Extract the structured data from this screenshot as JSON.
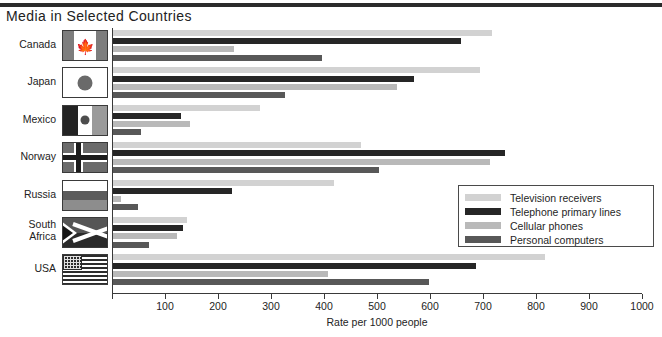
{
  "title": "Media in Selected Countries",
  "axis": {
    "xlabel": "Rate per 1000 people",
    "ticks": [
      0,
      100,
      200,
      300,
      400,
      500,
      600,
      700,
      800,
      900,
      1000
    ],
    "tick_labels": [
      "",
      "100",
      "200",
      "300",
      "400",
      "500",
      "600",
      "700",
      "800",
      "900",
      "1000"
    ]
  },
  "legend": {
    "items": [
      {
        "label": "Television receivers",
        "color": "#d2d2d2"
      },
      {
        "label": "Telephone primary lines",
        "color": "#262626"
      },
      {
        "label": "Cellular phones",
        "color": "#b9b9b9"
      },
      {
        "label": "Personal computers",
        "color": "#585858"
      }
    ]
  },
  "countries": [
    {
      "name": "Canada",
      "flag": "canada-flag"
    },
    {
      "name": "Japan",
      "flag": "japan-flag"
    },
    {
      "name": "Mexico",
      "flag": "mexico-flag"
    },
    {
      "name": "Norway",
      "flag": "norway-flag"
    },
    {
      "name": "Russia",
      "flag": "russia-flag"
    },
    {
      "name": "South Africa",
      "flag": "south-africa-flag"
    },
    {
      "name": "USA",
      "flag": "usa-flag"
    }
  ],
  "chart_data": {
    "type": "bar",
    "orientation": "horizontal",
    "title": "Media in Selected Countries",
    "xlabel": "Rate per 1000 people",
    "ylabel": "",
    "xlim": [
      0,
      1000
    ],
    "grid": false,
    "legend_position": "inside-right",
    "categories": [
      "Canada",
      "Japan",
      "Mexico",
      "Norway",
      "Russia",
      "South Africa",
      "USA"
    ],
    "series": [
      {
        "name": "Television receivers",
        "color": "#d2d2d2",
        "values": [
          715,
          693,
          278,
          467,
          417,
          139,
          815
        ]
      },
      {
        "name": "Telephone primary lines",
        "color": "#262626",
        "values": [
          657,
          568,
          128,
          739,
          225,
          132,
          685
        ]
      },
      {
        "name": "Cellular phones",
        "color": "#b9b9b9",
        "values": [
          229,
          535,
          145,
          712,
          16,
          120,
          405
        ]
      },
      {
        "name": "Personal computers",
        "color": "#585858",
        "values": [
          394,
          324,
          53,
          501,
          48,
          67,
          596
        ]
      }
    ]
  }
}
